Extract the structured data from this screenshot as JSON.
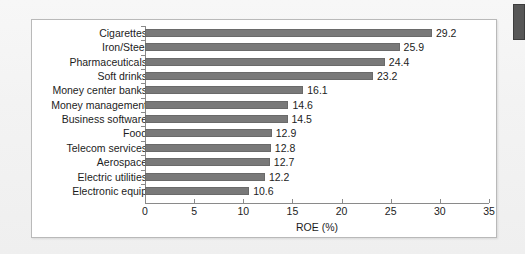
{
  "figure": {
    "edge_marker_name": "page-edge-marker",
    "frame_color": "#b9b9b9",
    "bar_color": "#797979",
    "text_color": "#1c1c1c"
  },
  "chart_data": {
    "type": "bar",
    "orientation": "horizontal",
    "title": "",
    "xlabel": "ROE (%)",
    "ylabel": "",
    "xlim": [
      0,
      35
    ],
    "xticks": [
      0,
      5,
      10,
      15,
      20,
      25,
      30,
      35
    ],
    "xtick_labels": [
      "0",
      "5",
      "10",
      "15",
      "20",
      "25",
      "30",
      "35"
    ],
    "grid": false,
    "legend": false,
    "value_labels": true,
    "categories": [
      "Cigarettes",
      "Iron/Steel",
      "Pharmaceuticals",
      "Soft drinks",
      "Money center banks",
      "Money management",
      "Business software",
      "Food",
      "Telecom services",
      "Aerospace",
      "Electric utilities",
      "Electronic equip"
    ],
    "values": [
      29.2,
      25.9,
      24.4,
      23.2,
      16.1,
      14.6,
      14.5,
      12.9,
      12.8,
      12.7,
      12.2,
      10.6
    ],
    "value_label_text": [
      "29.2",
      "25.9",
      "24.4",
      "23.2",
      "16.1",
      "14.6",
      "14.5",
      "12.9",
      "12.8",
      "12.7",
      "12.2",
      "10.6"
    ]
  }
}
